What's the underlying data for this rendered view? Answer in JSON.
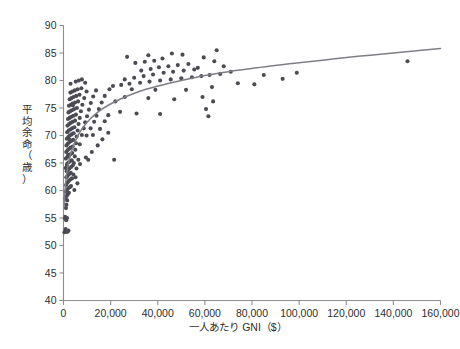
{
  "chart_data": {
    "type": "scatter",
    "title": "",
    "subtitle": "",
    "xlabel": "一人あたり GNI（$）",
    "ylabel": "平均余命（歳）",
    "xlim": [
      0,
      160000
    ],
    "ylim": [
      40,
      90
    ],
    "xticks": [
      0,
      20000,
      40000,
      60000,
      80000,
      100000,
      120000,
      140000,
      160000
    ],
    "xtick_labels": [
      "0",
      "20,000",
      "40,000",
      "60,000",
      "80,000",
      "100,000",
      "120,000",
      "140,000",
      "160,000"
    ],
    "yticks": [
      40,
      45,
      50,
      55,
      60,
      65,
      70,
      75,
      80,
      85,
      90
    ],
    "ytick_labels": [
      "40",
      "45",
      "50",
      "55",
      "60",
      "65",
      "70",
      "75",
      "80",
      "85",
      "90"
    ],
    "grid": false,
    "legend": null,
    "legend_position": "none",
    "point_color": "#4b4b53",
    "point_size": 4.1,
    "curve_color": "#7e7e86",
    "curve_width": 1.5,
    "axis_color": "#8d8d8d",
    "text_color": "#2e2e2e",
    "background": "#ffffff",
    "series": [
      {
        "name": "countries",
        "marker": "circle",
        "points": [
          [
            420,
            52.4
          ],
          [
            760,
            52.6
          ],
          [
            900,
            53.0
          ],
          [
            1150,
            54.6
          ],
          [
            640,
            54.9
          ],
          [
            1300,
            52.5
          ],
          [
            1700,
            52.5
          ],
          [
            2100,
            52.7
          ],
          [
            1500,
            55.0
          ],
          [
            700,
            55.2
          ],
          [
            1050,
            56.8
          ],
          [
            1250,
            57.4
          ],
          [
            1550,
            58.2
          ],
          [
            900,
            58.6
          ],
          [
            1350,
            59.0
          ],
          [
            1800,
            59.3
          ],
          [
            2300,
            59.6
          ],
          [
            1000,
            59.8
          ],
          [
            1450,
            60.1
          ],
          [
            2000,
            60.4
          ],
          [
            2600,
            60.6
          ],
          [
            3200,
            60.8
          ],
          [
            4600,
            60.1
          ],
          [
            5900,
            61.3
          ],
          [
            1100,
            61.0
          ],
          [
            1650,
            61.4
          ],
          [
            2150,
            61.7
          ],
          [
            2850,
            62.0
          ],
          [
            3600,
            62.2
          ],
          [
            1200,
            62.4
          ],
          [
            1750,
            62.7
          ],
          [
            2400,
            63.0
          ],
          [
            3100,
            63.2
          ],
          [
            4200,
            62.9
          ],
          [
            5100,
            62.4
          ],
          [
            1350,
            63.5
          ],
          [
            1900,
            63.8
          ],
          [
            2500,
            64.0
          ],
          [
            3300,
            64.3
          ],
          [
            4000,
            64.6
          ],
          [
            900,
            64.1
          ],
          [
            1500,
            64.8
          ],
          [
            2100,
            65.1
          ],
          [
            2750,
            65.3
          ],
          [
            3500,
            65.5
          ],
          [
            4400,
            65.0
          ],
          [
            6300,
            65.6
          ],
          [
            10500,
            65.6
          ],
          [
            21500,
            65.6
          ],
          [
            1000,
            65.8
          ],
          [
            1600,
            66.1
          ],
          [
            2250,
            66.4
          ],
          [
            2900,
            66.6
          ],
          [
            3700,
            66.8
          ],
          [
            4800,
            66.2
          ],
          [
            1150,
            67.0
          ],
          [
            1700,
            67.3
          ],
          [
            2350,
            67.6
          ],
          [
            3050,
            67.8
          ],
          [
            3900,
            68.0
          ],
          [
            5000,
            67.4
          ],
          [
            1250,
            68.2
          ],
          [
            1850,
            68.5
          ],
          [
            2500,
            68.8
          ],
          [
            3200,
            69.0
          ],
          [
            4100,
            69.2
          ],
          [
            5300,
            68.6
          ],
          [
            6900,
            68.4
          ],
          [
            1400,
            69.4
          ],
          [
            2000,
            69.7
          ],
          [
            2650,
            70.0
          ],
          [
            3400,
            70.2
          ],
          [
            4300,
            70.4
          ],
          [
            5600,
            69.8
          ],
          [
            7800,
            70.1
          ],
          [
            9800,
            70.0
          ],
          [
            12500,
            70.1
          ],
          [
            1550,
            70.6
          ],
          [
            2200,
            70.9
          ],
          [
            2900,
            71.1
          ],
          [
            3650,
            71.3
          ],
          [
            4600,
            71.5
          ],
          [
            6000,
            70.9
          ],
          [
            8600,
            71.3
          ],
          [
            11500,
            71.3
          ],
          [
            15500,
            71.2
          ],
          [
            1700,
            71.8
          ],
          [
            2400,
            72.1
          ],
          [
            3100,
            72.3
          ],
          [
            3900,
            72.5
          ],
          [
            4900,
            72.7
          ],
          [
            6400,
            72.1
          ],
          [
            9200,
            72.4
          ],
          [
            13000,
            72.5
          ],
          [
            17500,
            72.6
          ],
          [
            1900,
            73.0
          ],
          [
            2600,
            73.2
          ],
          [
            3350,
            73.4
          ],
          [
            4200,
            73.6
          ],
          [
            5300,
            73.8
          ],
          [
            6900,
            73.2
          ],
          [
            10000,
            73.5
          ],
          [
            14000,
            73.6
          ],
          [
            19000,
            73.7
          ],
          [
            2100,
            74.2
          ],
          [
            2850,
            74.4
          ],
          [
            3600,
            74.6
          ],
          [
            4500,
            74.8
          ],
          [
            5700,
            75.0
          ],
          [
            7400,
            74.4
          ],
          [
            10800,
            74.7
          ],
          [
            15000,
            74.8
          ],
          [
            24000,
            74.3
          ],
          [
            31000,
            74.0
          ],
          [
            41000,
            73.9
          ],
          [
            61500,
            73.5
          ],
          [
            2300,
            75.4
          ],
          [
            3100,
            75.6
          ],
          [
            3900,
            75.8
          ],
          [
            4900,
            76.0
          ],
          [
            6200,
            76.2
          ],
          [
            8000,
            75.6
          ],
          [
            11600,
            75.9
          ],
          [
            16200,
            76.0
          ],
          [
            22000,
            76.2
          ],
          [
            2600,
            76.6
          ],
          [
            3400,
            76.8
          ],
          [
            4300,
            77.0
          ],
          [
            5400,
            77.2
          ],
          [
            6800,
            77.4
          ],
          [
            8800,
            76.8
          ],
          [
            12600,
            77.1
          ],
          [
            17500,
            77.2
          ],
          [
            26000,
            77.0
          ],
          [
            36000,
            76.8
          ],
          [
            47000,
            76.6
          ],
          [
            59000,
            77.0
          ],
          [
            2900,
            77.8
          ],
          [
            3800,
            78.0
          ],
          [
            4800,
            78.2
          ],
          [
            6000,
            78.4
          ],
          [
            7600,
            78.6
          ],
          [
            9800,
            78.0
          ],
          [
            13800,
            78.2
          ],
          [
            19500,
            78.4
          ],
          [
            9200,
            79.6
          ],
          [
            29000,
            78.4
          ],
          [
            39000,
            78.3
          ],
          [
            52000,
            78.3
          ],
          [
            63000,
            78.8
          ],
          [
            81000,
            79.3
          ],
          [
            74000,
            79.5
          ],
          [
            21000,
            79.0
          ],
          [
            24500,
            79.2
          ],
          [
            28000,
            79.4
          ],
          [
            32500,
            79.6
          ],
          [
            36500,
            79.8
          ],
          [
            41000,
            80.0
          ],
          [
            45500,
            80.2
          ],
          [
            50000,
            80.4
          ],
          [
            54500,
            80.6
          ],
          [
            58500,
            80.8
          ],
          [
            62000,
            81.0
          ],
          [
            66500,
            81.2
          ],
          [
            26000,
            80.2
          ],
          [
            30000,
            80.5
          ],
          [
            34000,
            80.8
          ],
          [
            38000,
            81.1
          ],
          [
            42500,
            81.4
          ],
          [
            46500,
            81.6
          ],
          [
            51000,
            81.8
          ],
          [
            55500,
            82.0
          ],
          [
            33000,
            81.8
          ],
          [
            37000,
            82.1
          ],
          [
            40500,
            82.4
          ],
          [
            44500,
            82.6
          ],
          [
            48500,
            82.8
          ],
          [
            53000,
            83.0
          ],
          [
            57000,
            82.3
          ],
          [
            30500,
            83.2
          ],
          [
            34500,
            83.4
          ],
          [
            38500,
            83.6
          ],
          [
            42000,
            84.0
          ],
          [
            27000,
            84.3
          ],
          [
            36000,
            84.6
          ],
          [
            46000,
            84.9
          ],
          [
            50500,
            84.7
          ],
          [
            59500,
            84.2
          ],
          [
            64000,
            83.5
          ],
          [
            68000,
            82.6
          ],
          [
            71000,
            81.6
          ],
          [
            65000,
            85.5
          ],
          [
            146000,
            83.5
          ],
          [
            60500,
            74.8
          ],
          [
            63500,
            76.2
          ],
          [
            85000,
            81.0
          ],
          [
            93000,
            80.3
          ],
          [
            99000,
            81.4
          ],
          [
            19000,
            70.5
          ],
          [
            16500,
            69.3
          ],
          [
            14500,
            68.2
          ],
          [
            12000,
            67.0
          ],
          [
            9500,
            66.0
          ],
          [
            7000,
            64.8
          ],
          [
            5500,
            64.0
          ],
          [
            4000,
            75.5
          ],
          [
            5200,
            79.8
          ],
          [
            6500,
            80.0
          ],
          [
            7800,
            80.2
          ],
          [
            3000,
            79.4
          ],
          [
            2600,
            69.2
          ],
          [
            2000,
            66.5
          ],
          [
            1500,
            64.5
          ]
        ]
      }
    ],
    "trend_curve": {
      "name": "logarithmic fit",
      "points": [
        [
          300,
          57.2
        ],
        [
          800,
          61.0
        ],
        [
          1600,
          63.8
        ],
        [
          2600,
          65.9
        ],
        [
          4000,
          67.9
        ],
        [
          6000,
          69.9
        ],
        [
          8500,
          71.6
        ],
        [
          11500,
          73.1
        ],
        [
          15000,
          74.4
        ],
        [
          19000,
          75.5
        ],
        [
          24000,
          76.6
        ],
        [
          29000,
          77.5
        ],
        [
          35000,
          78.4
        ],
        [
          42000,
          79.2
        ],
        [
          50000,
          80.0
        ],
        [
          60000,
          80.9
        ],
        [
          70000,
          81.6
        ],
        [
          82000,
          82.3
        ],
        [
          95000,
          83.0
        ],
        [
          110000,
          83.7
        ],
        [
          125000,
          84.4
        ],
        [
          140000,
          85.0
        ],
        [
          152000,
          85.5
        ],
        [
          160000,
          85.8
        ]
      ]
    }
  }
}
